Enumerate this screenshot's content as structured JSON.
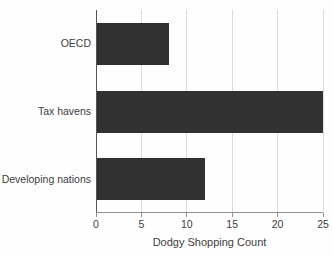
{
  "chart_data": {
    "type": "bar",
    "orientation": "horizontal",
    "title": "",
    "categories": [
      "OECD",
      "Tax havens",
      "Developing nations"
    ],
    "values": [
      8,
      25,
      12
    ],
    "xlabel": "Dodgy Shopping Count",
    "ylabel": "",
    "xlim": [
      0,
      25
    ],
    "xticks": [
      0,
      5,
      10,
      15,
      20,
      25
    ],
    "grid": "vertical gridlines at x ticks",
    "legend": "none",
    "colors": {
      "bar_fill": "#313131",
      "gridline": "#dcdcdc",
      "left_spine": "#565656",
      "bottom_spine": "#8f8f8f",
      "text": "#3d3d3d",
      "background": "#fefefe"
    }
  }
}
